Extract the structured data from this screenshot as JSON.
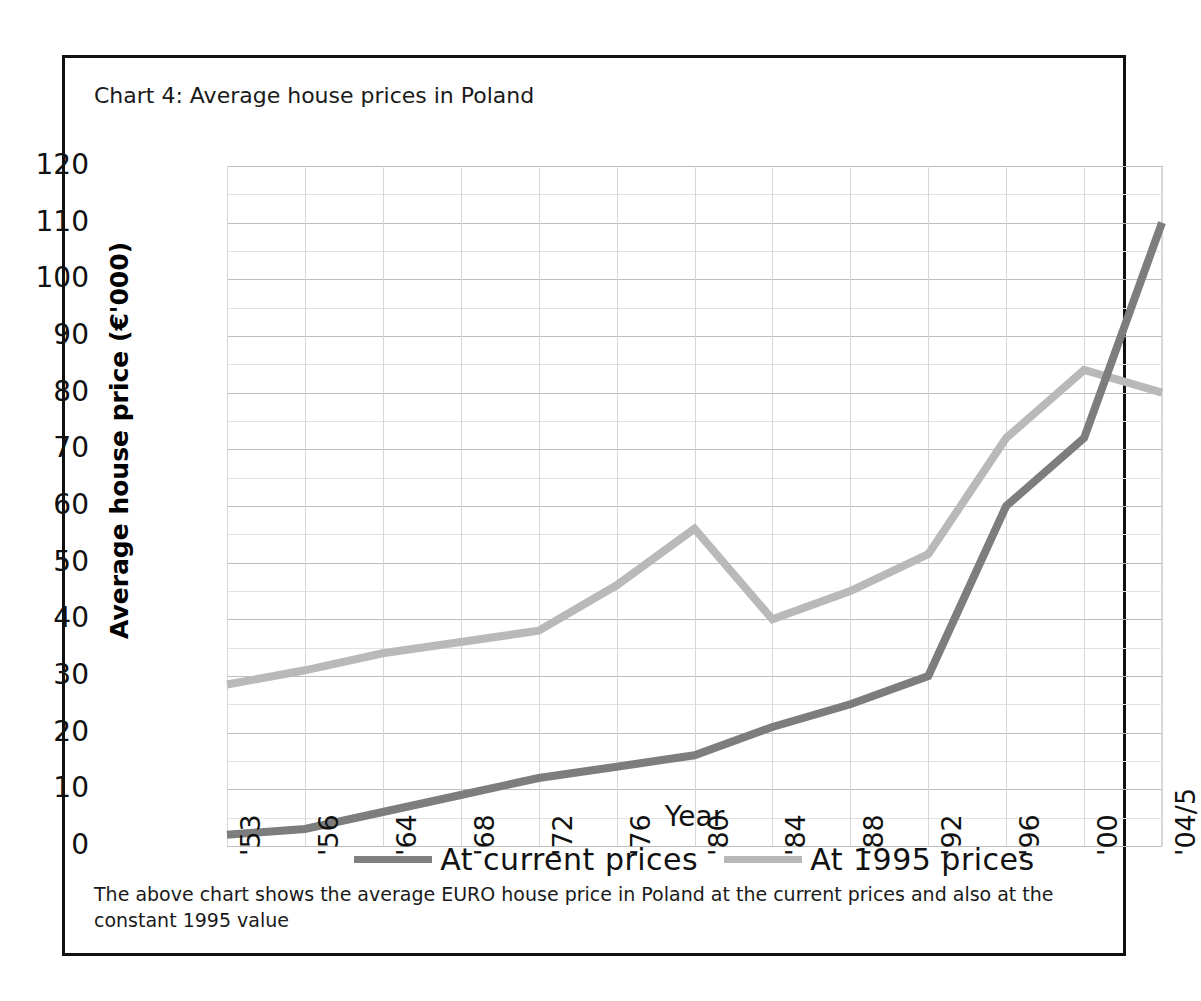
{
  "chart_title": "Chart 4: Average house prices in Poland",
  "caption": "The above chart shows the average EURO house price in Poland at the current prices and also at the constant 1995 value",
  "axes": {
    "y_title": "Average house price (€'000)",
    "x_title": "Year",
    "y_ticks": [
      "120",
      "110",
      "100",
      "90",
      "80",
      "70",
      "60",
      "50",
      "40",
      "30",
      "20",
      "10",
      "0"
    ],
    "x_ticks": [
      "'53",
      "'56",
      "'64",
      "'68",
      "'72",
      "'76",
      "'80",
      "'84",
      "'88",
      "'92",
      "'96",
      "'00",
      "'04/5"
    ]
  },
  "legend": {
    "items": [
      {
        "label": "At current prices",
        "color": "#808080"
      },
      {
        "label": "At 1995 prices",
        "color": "#b8b8b8"
      }
    ]
  },
  "colors": {
    "current_prices_line": "#7d7d7d",
    "prices_1995_line": "#b9b9b9",
    "frame": "#111111",
    "grid_major": "#bdbdbd",
    "grid_minor": "#e2e2e2"
  },
  "chart_data": {
    "type": "line",
    "title": "Chart 4: Average house prices in Poland",
    "xlabel": "Year",
    "ylabel": "Average house price (€'000)",
    "categories": [
      "'53",
      "'56",
      "'64",
      "'68",
      "'72",
      "'76",
      "'80",
      "'84",
      "'88",
      "'92",
      "'96",
      "'00",
      "'04/5"
    ],
    "ylim": [
      0,
      120
    ],
    "ytick_step": 10,
    "grid": true,
    "legend_position": "bottom",
    "series": [
      {
        "name": "At current prices",
        "color": "#7d7d7d",
        "values": [
          2,
          3,
          6,
          9,
          12,
          14,
          16,
          21,
          25,
          30,
          60,
          72,
          110
        ]
      },
      {
        "name": "At 1995 prices",
        "color": "#b9b9b9",
        "values": [
          28.5,
          31,
          34,
          36,
          38,
          46,
          56,
          40,
          45,
          51.5,
          72,
          84,
          80
        ]
      }
    ]
  }
}
